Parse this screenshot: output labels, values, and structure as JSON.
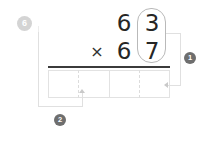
{
  "worksheet": {
    "step_number": "6",
    "problem": {
      "multiplicand": {
        "tens": "6",
        "ones": "3"
      },
      "multiplier": {
        "tens": "6",
        "ones": "7"
      },
      "operator": "×"
    },
    "highlight": {
      "name": "ones-column-capsule",
      "covers": [
        "3",
        "7"
      ]
    },
    "answer_cells": [
      {
        "value": ""
      },
      {
        "value": ""
      },
      {
        "value": ""
      },
      {
        "value": ""
      }
    ],
    "callouts": [
      {
        "id": "1",
        "label": "1",
        "target": "answer-cell-4"
      },
      {
        "id": "2",
        "label": "2",
        "target": "answer-cell-1"
      }
    ],
    "colors": {
      "digit": "#262626",
      "rule": "#3b3b3b",
      "cell_border": "#e2e2e2",
      "capsule_border": "#b9b9b9",
      "badge_muted": "#d4d4d4",
      "badge_dark": "#6e6e6e",
      "connector": "#e0e0e0",
      "background": "#ffffff"
    }
  }
}
